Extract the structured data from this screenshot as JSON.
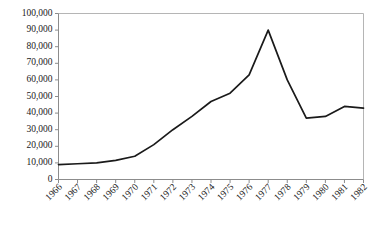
{
  "chart_data": {
    "type": "line",
    "title": "",
    "subtitle": "",
    "xlabel": "",
    "ylabel": "",
    "grid": false,
    "legend": false,
    "legend_position": "none",
    "x": [
      1966,
      1967,
      1968,
      1969,
      1970,
      1971,
      1972,
      1973,
      1974,
      1975,
      1976,
      1977,
      1978,
      1979,
      1980,
      1981,
      1982
    ],
    "categories": [
      "1966",
      "1967",
      "1968",
      "1969",
      "1970",
      "1971",
      "1972",
      "1973",
      "1974",
      "1975",
      "1976",
      "1977",
      "1978",
      "1979",
      "1980",
      "1981",
      "1982"
    ],
    "values": [
      9000,
      9500,
      10000,
      11500,
      14000,
      21000,
      30000,
      38000,
      47000,
      52000,
      63000,
      90000,
      60000,
      37000,
      38000,
      44000,
      43000
    ],
    "series": [
      {
        "name": "",
        "color": "#1a1a1a",
        "values": [
          9000,
          9500,
          10000,
          11500,
          14000,
          21000,
          30000,
          38000,
          47000,
          52000,
          63000,
          90000,
          60000,
          37000,
          38000,
          44000,
          43000
        ]
      }
    ],
    "xlim": [
      1966,
      1982
    ],
    "ylim": [
      0,
      100000
    ],
    "ytick_values": [
      0,
      10000,
      20000,
      30000,
      40000,
      50000,
      60000,
      70000,
      80000,
      90000,
      100000
    ],
    "ytick_labels": [
      "0",
      "10,000",
      "20,000",
      "30,000",
      "40,000",
      "50,000",
      "60,000",
      "70,000",
      "80,000",
      "90,000",
      "100,000"
    ],
    "xtick_labels": [
      "1966",
      "1967",
      "1968",
      "1969",
      "1970",
      "1971",
      "1972",
      "1973",
      "1974",
      "1975",
      "1976",
      "1977",
      "1978",
      "1979",
      "1980",
      "1981",
      "1982"
    ],
    "xtick_label_rotation": -45,
    "annotations": []
  },
  "style": {
    "line_color": "#1a1a1a",
    "axis_color": "#8c8c8c",
    "border_color": "#b5b5b5",
    "text_color": "#1a1a1a",
    "background": "#ffffff"
  }
}
